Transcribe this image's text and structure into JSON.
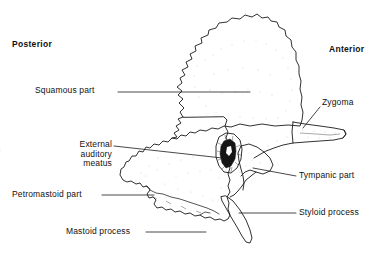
{
  "figure": {
    "background_color": "#ffffff",
    "ink_color": "#111111",
    "width": 379,
    "height": 256
  },
  "orientation": {
    "posterior": "Posterior",
    "anterior": "Anterior"
  },
  "labels": [
    {
      "id": "squamous",
      "text": "Squamous part"
    },
    {
      "id": "zygoma",
      "text": "Zygoma"
    },
    {
      "id": "eam",
      "text": "External\nauditory\nmeatus"
    },
    {
      "id": "petro",
      "text": "Petromastoid part"
    },
    {
      "id": "mastoid",
      "text": "Mastoid process"
    },
    {
      "id": "tympanic",
      "text": "Tympanic part"
    },
    {
      "id": "styloid",
      "text": "Styloid process"
    }
  ],
  "label_text": {
    "squamous": "Squamous part",
    "zygoma": "Zygoma",
    "eam": "External\nauditory\nmeatus",
    "petro": "Petromastoid part",
    "mastoid": "Mastoid process",
    "tympanic": "Tympanic part",
    "styloid": "Styloid process"
  },
  "structures": [
    "Squamous part",
    "Zygoma",
    "External auditory meatus",
    "Petromastoid part",
    "Mastoid process",
    "Tympanic part",
    "Styloid process"
  ]
}
